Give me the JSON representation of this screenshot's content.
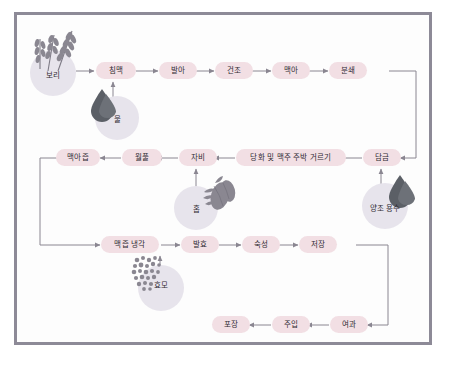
{
  "diagram": {
    "title": "",
    "frame_border_color": "#8d8a97",
    "box_fill_color": "#f2dfe4",
    "circle_fill_color": "#e7e4ec",
    "arrow_color": "#8a8691",
    "text_color": "#2f2b33",
    "drop_color": "#5b5f66",
    "rows": [
      {
        "name": "malting-row",
        "steps": [
          {
            "label": "침맥"
          },
          {
            "label": "발아"
          },
          {
            "label": "건조"
          },
          {
            "label": "맥아"
          },
          {
            "label": "분쇄"
          }
        ]
      },
      {
        "name": "mashing-row",
        "steps": [
          {
            "label": "맥아즙"
          },
          {
            "label": "월풀"
          },
          {
            "label": "자비"
          },
          {
            "label": "당화 및 맥주 주박 거르기"
          },
          {
            "label": "담금"
          }
        ]
      },
      {
        "name": "fermentation-row",
        "steps": [
          {
            "label": "맥즙 냉각"
          },
          {
            "label": "발효"
          },
          {
            "label": "숙성"
          },
          {
            "label": "저장"
          }
        ]
      },
      {
        "name": "packaging-row",
        "steps": [
          {
            "label": "포장"
          },
          {
            "label": "주입"
          },
          {
            "label": "여과"
          }
        ]
      }
    ],
    "ingredients": [
      {
        "label": "보리",
        "icon": "barley-icon"
      },
      {
        "label": "물",
        "icon": "water-drop-icon"
      },
      {
        "label": "홉",
        "icon": "hop-cone-icon"
      },
      {
        "label": "양조 용수",
        "icon": "water-drop-icon"
      },
      {
        "label": "효모",
        "icon": "yeast-cells-icon"
      }
    ]
  }
}
